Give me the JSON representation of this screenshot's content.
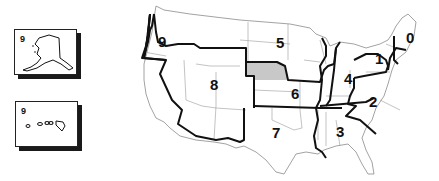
{
  "map": {
    "title": "US call districts",
    "highlight_color": "#c8c8c8",
    "border_color": "#111111",
    "state_line_color": "#9a9a9a",
    "highlighted_state": "Nebraska",
    "insets": [
      {
        "name": "Alaska",
        "district": "9"
      },
      {
        "name": "Hawaii",
        "district": "9"
      }
    ],
    "districts": [
      {
        "label": "0",
        "x": 266,
        "y": 43
      },
      {
        "label": "1",
        "x": 239,
        "y": 64
      },
      {
        "label": "2",
        "x": 233,
        "y": 107
      },
      {
        "label": "3",
        "x": 200,
        "y": 136
      },
      {
        "label": "4",
        "x": 208,
        "y": 84
      },
      {
        "label": "5",
        "x": 141,
        "y": 48
      },
      {
        "label": "6",
        "x": 156,
        "y": 99
      },
      {
        "label": "7",
        "x": 137,
        "y": 137
      },
      {
        "label": "8",
        "x": 75,
        "y": 90
      },
      {
        "label": "9",
        "x": 23,
        "y": 46
      }
    ]
  }
}
